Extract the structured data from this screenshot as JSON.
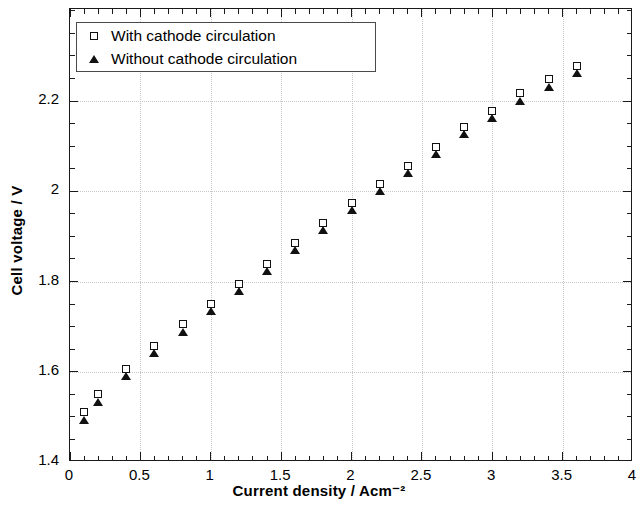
{
  "chart_data": {
    "type": "scatter",
    "title": "",
    "xlabel": "Current density / Acm⁻²",
    "ylabel": "Cell voltage / V",
    "xlim": [
      0,
      4
    ],
    "ylim": [
      1.4,
      2.404
    ],
    "grid": true,
    "legend_position": "top-left",
    "x_ticks": [
      0,
      0.5,
      1,
      1.5,
      2,
      2.5,
      3,
      3.5,
      4
    ],
    "x_tick_labels": [
      "0",
      "0.5",
      "1",
      "1.5",
      "2",
      "2.5",
      "3",
      "3.5",
      "4"
    ],
    "x_minor_tick_step": 0.1,
    "y_ticks": [
      1.4,
      1.6,
      1.8,
      2.0,
      2.2
    ],
    "y_tick_labels": [
      "1.4",
      "1.6",
      "1.8",
      "2",
      "2.2"
    ],
    "y_minor_tick_step": 0.05,
    "x": [
      0.1,
      0.2,
      0.4,
      0.6,
      0.8,
      1.0,
      1.2,
      1.4,
      1.6,
      1.8,
      2.0,
      2.2,
      2.4,
      2.6,
      2.8,
      3.0,
      3.2,
      3.4,
      3.6
    ],
    "series": [
      {
        "name": "With cathode circulation",
        "marker": "open-square",
        "color": "#111111",
        "values": [
          1.505,
          1.545,
          1.602,
          1.652,
          1.7,
          1.745,
          1.79,
          1.835,
          1.88,
          1.925,
          1.97,
          2.012,
          2.052,
          2.093,
          2.137,
          2.173,
          2.212,
          2.243,
          2.272
        ]
      },
      {
        "name": "Without cathode circulation",
        "marker": "filled-triangle",
        "color": "#111111",
        "values": [
          1.498,
          1.538,
          1.596,
          1.646,
          1.694,
          1.739,
          1.784,
          1.829,
          1.874,
          1.919,
          1.964,
          2.006,
          2.046,
          2.087,
          2.131,
          2.167,
          2.206,
          2.237,
          2.266
        ]
      }
    ]
  },
  "legend": {
    "entries": [
      {
        "label": "With cathode circulation",
        "marker": "open-square"
      },
      {
        "label": "Without cathode circulation",
        "marker": "filled-triangle"
      }
    ]
  },
  "axes": {
    "x_title": "Current density / Acm⁻²",
    "y_title": "Cell voltage / V"
  }
}
